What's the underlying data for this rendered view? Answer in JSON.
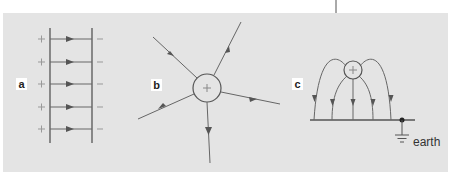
{
  "figure": {
    "panels": [
      {
        "id": "a",
        "label": "a",
        "description": "Uniform field between parallel plates",
        "plus_sign": "+",
        "minus_sign": "–",
        "field_line_count": 5
      },
      {
        "id": "b",
        "label": "b",
        "description": "Radial field from isolated positive charge",
        "charge_sign": "+",
        "field_line_count": 5
      },
      {
        "id": "c",
        "label": "c",
        "description": "Field between positive charge and earthed plate",
        "charge_sign": "+",
        "field_line_count": 5,
        "earth_label": "earth"
      }
    ]
  },
  "colors": {
    "panel_bg": "#e4e4e4",
    "line": "#555555",
    "label_bg": "#ffffff"
  }
}
